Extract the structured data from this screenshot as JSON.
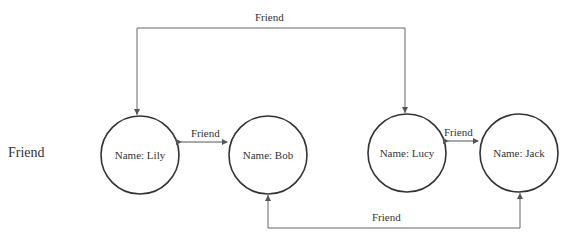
{
  "side_label": "Friend",
  "nodes": [
    {
      "id": "lily",
      "label": "Name: Lily",
      "cx": 140,
      "cy": 155,
      "r": 39
    },
    {
      "id": "bob",
      "label": "Name: Bob",
      "cx": 268,
      "cy": 155,
      "r": 39
    },
    {
      "id": "lucy",
      "label": "Name: Lucy",
      "cx": 407,
      "cy": 153,
      "r": 39
    },
    {
      "id": "jack",
      "label": "Name: Jack",
      "cx": 519,
      "cy": 153,
      "r": 39
    }
  ],
  "edges": [
    {
      "from": "lily",
      "to": "bob",
      "label": "Friend",
      "direction": "bidirectional"
    },
    {
      "from": "lucy",
      "to": "jack",
      "label": "Friend",
      "direction": "bidirectional"
    },
    {
      "from": "lucy",
      "to": "lily",
      "label": "Friend",
      "direction": "both-ends-arrow-top-route"
    },
    {
      "from": "jack",
      "to": "bob",
      "label": "Friend",
      "direction": "both-ends-arrow-bottom-route"
    }
  ],
  "edge_labels": {
    "top": "Friend",
    "lily_bob": "Friend",
    "lucy_jack": "Friend",
    "bottom": "Friend"
  },
  "colors": {
    "stroke": "#333333",
    "line": "#666666",
    "background": "#ffffff"
  }
}
